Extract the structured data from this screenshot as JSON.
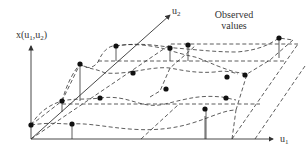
{
  "labels": {
    "y_axis": "x(u",
    "y_axis_sub1": "1",
    "y_axis_mid": ",u",
    "y_axis_sub2": "2",
    "y_axis_close": ")",
    "u2_axis": "u",
    "u2_sub": "2",
    "u1_axis": "u",
    "u1_sub": "1",
    "annotation_line1": "Observed",
    "annotation_line2": "values"
  },
  "diagram": {
    "type": "3d-surface-sketch",
    "grid_rows": 5,
    "points_per_row": 3
  }
}
